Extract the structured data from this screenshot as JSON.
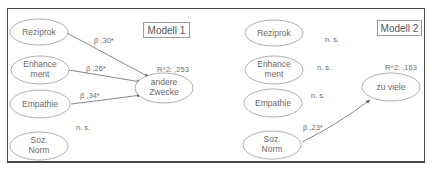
{
  "models": [
    {
      "title": "Modell 1",
      "predictors": [
        {
          "label_lines": [
            "Reziprok"
          ],
          "path": "β ,30*"
        },
        {
          "label_lines": [
            "Enhance",
            "ment"
          ],
          "path": "β ,26*"
        },
        {
          "label_lines": [
            "Empathie"
          ],
          "path": "β ,34*"
        },
        {
          "label_lines": [
            "Soz.",
            "Norm"
          ],
          "path": "n. s."
        }
      ],
      "outcome": {
        "label_lines": [
          "andere",
          "Zwecke"
        ]
      },
      "r2": "R^2: ,253"
    },
    {
      "title": "Modell 2",
      "predictors": [
        {
          "label_lines": [
            "Reziprok"
          ],
          "path": "n. s."
        },
        {
          "label_lines": [
            "Enhance",
            "ment"
          ],
          "path": "n. s."
        },
        {
          "label_lines": [
            "Empathie"
          ],
          "path": "n. s."
        },
        {
          "label_lines": [
            "Soz.",
            "Norm"
          ],
          "path": "β ,23*"
        }
      ],
      "outcome": {
        "label_lines": [
          "zu viele"
        ]
      },
      "r2": "R^2: ,163"
    }
  ],
  "colors": {
    "frame": "#4a4a4a",
    "ellipse": "#9a9a9a",
    "arrow": "#6a6a6a",
    "text": "#6a6a6a"
  }
}
